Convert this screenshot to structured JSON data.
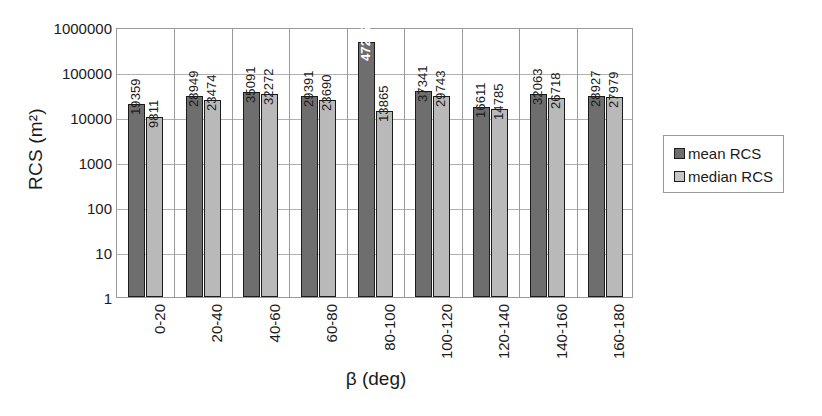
{
  "chart_data": {
    "type": "bar",
    "title": "",
    "xlabel": "β (deg)",
    "ylabel": "RCS (m²)",
    "yscale": "log",
    "ylim": [
      1,
      1000000
    ],
    "ytick_labels": [
      "1000000",
      "100000",
      "10000",
      "1000",
      "100",
      "10",
      "1"
    ],
    "grid": true,
    "legend_position": "right",
    "categories": [
      "0-20",
      "20-40",
      "40-60",
      "60-80",
      "80-100",
      "100-120",
      "120-140",
      "140-160",
      "160-180"
    ],
    "series": [
      {
        "name": "mean RCS",
        "color": "#6e6e6e",
        "values": [
          19359,
          28949,
          35091,
          29391,
          472177,
          37341,
          16611,
          32063,
          28927
        ]
      },
      {
        "name": "median RCS",
        "color": "#b9b9b9",
        "values": [
          9811,
          23474,
          32272,
          23690,
          13865,
          29743,
          14785,
          26718,
          27979
        ]
      }
    ]
  },
  "legend": {
    "entries": [
      {
        "label": "mean RCS",
        "swatch": "mean"
      },
      {
        "label": "median RCS",
        "swatch": "median"
      }
    ]
  }
}
